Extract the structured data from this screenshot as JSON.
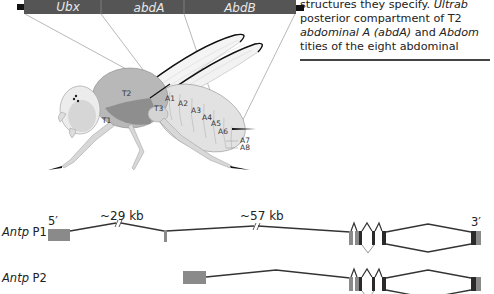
{
  "caption": {
    "lines": [
      {
        "parts": [
          {
            "text": "structures they specify. ",
            "italic": false
          },
          {
            "text": "Ultrab",
            "italic": true
          }
        ]
      },
      {
        "parts": [
          {
            "text": "posterior compartment of T2",
            "italic": false
          }
        ]
      },
      {
        "parts": [
          {
            "text": "abdominal A (abdA)",
            "italic": true
          },
          {
            "text": " and ",
            "italic": false
          },
          {
            "text": "Abdom",
            "italic": true
          }
        ]
      },
      {
        "parts": [
          {
            "text": "tities of the eight abdominal",
            "italic": false
          }
        ]
      }
    ]
  },
  "complex_bar": {
    "genes": [
      "Ubx",
      "abdA",
      "AbdB"
    ],
    "bar_color": "#555555"
  },
  "fly": {
    "segment_labels": [
      "T1",
      "T2",
      "T3",
      "A1",
      "A2",
      "A3",
      "A4",
      "A5",
      "A6",
      "A7",
      "A8"
    ]
  },
  "gene_structure": {
    "transcripts": [
      {
        "label_italic": "Antp",
        "label_plain": " P1"
      },
      {
        "label_italic": "Antp",
        "label_plain": " P2"
      }
    ],
    "five_prime": "5′",
    "three_prime": "3′",
    "intron_sizes": [
      "~29 kb",
      "~57 kb"
    ],
    "colors": {
      "untranslated_exon": "#8a8a8a",
      "coding_exon": "#2a2a2a",
      "intron_line": "#333333"
    }
  }
}
